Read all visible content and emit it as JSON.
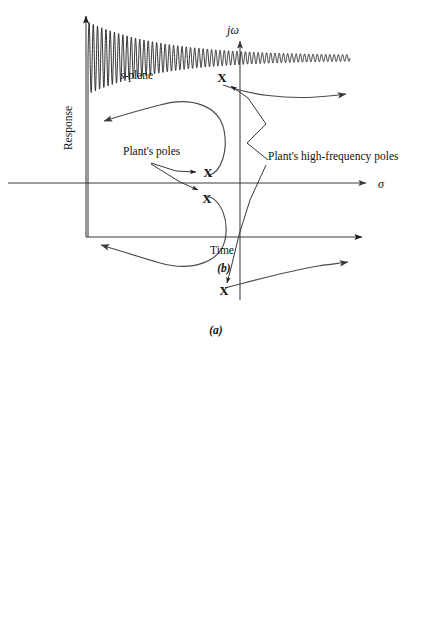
{
  "figure": {
    "title_a_caption": "(a)",
    "title_b_caption": "(b)"
  },
  "panel_a": {
    "name": "s-plane root locus",
    "plane_label_italic": "s",
    "plane_label_rest": "-plane",
    "imaginary_axis_label": "jω",
    "real_axis_label": "σ",
    "pole_marker_glyph": "X",
    "annotations": [
      {
        "id": "plants-poles",
        "text": "Plant's poles",
        "x": 123,
        "y": 155
      },
      {
        "id": "plants-high-frequency-poles",
        "text": "Plant's high-frequency poles",
        "x": 268,
        "y": 160
      }
    ],
    "poles": [
      {
        "id": "hf-pole-upper",
        "label": "X",
        "x": 222,
        "y": 82
      },
      {
        "id": "plant-pole-upper",
        "label": "X",
        "x": 208,
        "y": 173
      },
      {
        "id": "plant-pole-lower",
        "label": "X",
        "x": 207,
        "y": 199
      },
      {
        "id": "hf-pole-lower",
        "label": "X",
        "x": 224,
        "y": 291
      }
    ],
    "caption": "(a)"
  },
  "panel_b": {
    "name": "step response with high-frequency oscillation",
    "y_axis_label": "Response",
    "x_axis_label": "Time",
    "caption": "(b)"
  },
  "colors": {
    "ink": "#111111",
    "line": "#3a3a3a",
    "locus": "#4a4a4a",
    "response": "#1a1a1a",
    "background": "#ffffff"
  },
  "chart_data": {
    "type": "line",
    "title": "",
    "xlabel": "Time",
    "ylabel": "Response",
    "grid": false,
    "legend": null,
    "xlim": [
      0,
      1
    ],
    "ylim": [
      0,
      1
    ],
    "series": [
      {
        "name": "Response",
        "comment": "envelope model: y(t) = steady + A0*exp(-t/tau)*sin(2*pi*f*t)",
        "steady_state": 0.62,
        "initial_overshoot": 0.93,
        "initial_undershoot": 0.38,
        "final_amplitude": 0.02,
        "decay_tau": 0.28,
        "oscillation_cycles": 62,
        "t_start": 0.03,
        "t_end": 0.93
      }
    ]
  },
  "geometry": {
    "panel_a": {
      "real_axis": {
        "x1": 8,
        "y1": 183,
        "x2": 372,
        "y2": 183
      },
      "imag_axis": {
        "x1": 240,
        "y1": 300,
        "x2": 240,
        "y2": 37
      },
      "locus_left_upper_arrow": {
        "x": 98,
        "y": 122
      },
      "locus_left_lower_arrow": {
        "x": 95,
        "y": 245
      },
      "locus_right_upper_arrow": {
        "x": 350,
        "y": 95
      },
      "locus_right_lower_arrow": {
        "x": 352,
        "y": 263
      }
    },
    "panel_b": {
      "y_axis": {
        "x": 86,
        "y_top": 352,
        "y_bottom": 577
      },
      "x_axis": {
        "y": 577,
        "x_left": 86,
        "x_right": 368
      },
      "signal_baseline_y": 398,
      "signal_start_x": 88,
      "signal_end_x": 350
    }
  }
}
